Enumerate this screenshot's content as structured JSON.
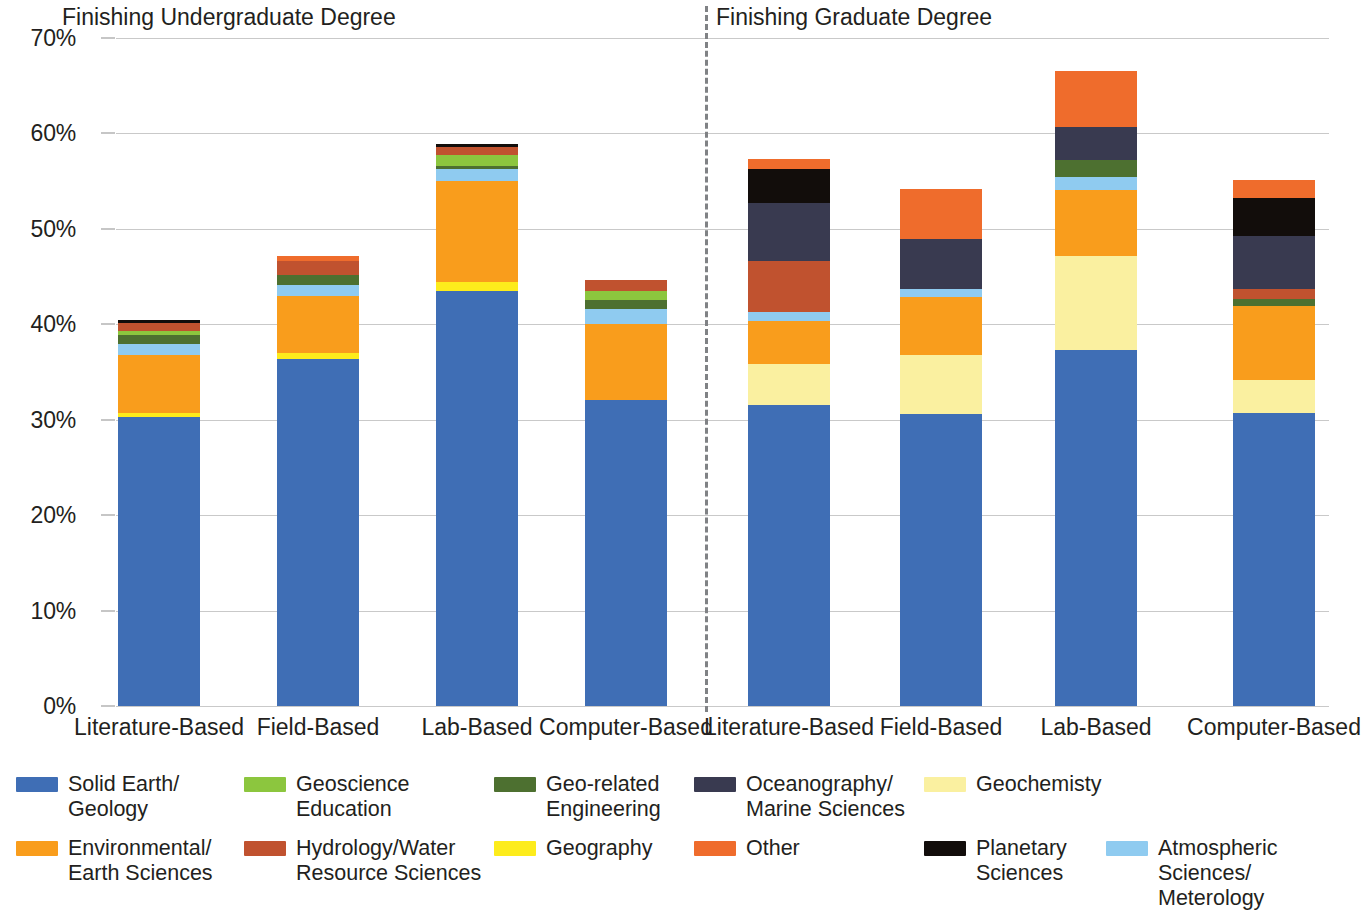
{
  "chart_data": {
    "type": "bar",
    "subtype": "stacked-column",
    "title": "",
    "xlabel": "",
    "ylabel": "Percentage of Graduates Participating in Self-Directed Research",
    "ylim": [
      0,
      70
    ],
    "ytick_values": [
      0,
      10,
      20,
      30,
      40,
      50,
      60,
      70
    ],
    "ytick_labels": [
      "0%",
      "10%",
      "20%",
      "30%",
      "40%",
      "50%",
      "60%",
      "70%"
    ],
    "grid": true,
    "legend_position": "bottom",
    "group_headers": [
      "Finishing Undergraduate Degree",
      "Finishing Graduate Degree"
    ],
    "categories": [
      "Literature-Based",
      "Field-Based",
      "Lab-Based",
      "Computer-Based",
      "Literature-Based",
      "Field-Based",
      "Lab-Based",
      "Computer-Based"
    ],
    "series": [
      {
        "name": "Solid Earth/\nGeology",
        "color": "#3f6eb5",
        "values": [
          30.3,
          36.4,
          43.5,
          32.1,
          31.5,
          30.6,
          37.3,
          30.7
        ]
      },
      {
        "name": "Geography",
        "color": "#fdec1c",
        "values": [
          0.4,
          0.6,
          0.9,
          0.0,
          0.0,
          0.0,
          0.0,
          0.0
        ]
      },
      {
        "name": "Geochemisty",
        "color": "#faf0a0",
        "values": [
          0.0,
          0.0,
          0.0,
          0.0,
          4.3,
          6.2,
          9.9,
          3.5
        ]
      },
      {
        "name": "Environmental/\nEarth Sciences",
        "color": "#f99d1c",
        "values": [
          6.1,
          6.0,
          10.6,
          7.9,
          4.5,
          6.1,
          6.9,
          7.7
        ]
      },
      {
        "name": "Atmospheric Sciences/\nMeterology",
        "color": "#8fcbf0",
        "values": [
          1.1,
          1.1,
          1.3,
          1.6,
          1.0,
          0.8,
          1.3,
          0.0
        ]
      },
      {
        "name": "Geo-related\nEngineering",
        "color": "#4d7030",
        "values": [
          1.0,
          1.1,
          0.3,
          1.0,
          0.0,
          0.0,
          1.8,
          0.8
        ]
      },
      {
        "name": "Geoscience\nEducation",
        "color": "#8cc63e",
        "values": [
          0.4,
          0.0,
          1.1,
          0.9,
          0.0,
          0.0,
          0.0,
          0.0
        ]
      },
      {
        "name": "Hydrology/Water\nResource Sciences",
        "color": "#c0522f",
        "values": [
          0.8,
          1.4,
          0.9,
          1.1,
          5.3,
          0.0,
          0.0,
          1.0
        ]
      },
      {
        "name": "Oceanography/\nMarine Sciences",
        "color": "#393a50",
        "values": [
          0.0,
          0.0,
          0.0,
          0.0,
          6.1,
          5.2,
          3.5,
          5.6
        ]
      },
      {
        "name": "Planetary\nSciences",
        "color": "#120d0b",
        "values": [
          0.4,
          0.0,
          0.3,
          0.0,
          3.6,
          0.0,
          0.0,
          3.9
        ]
      },
      {
        "name": "Other",
        "color": "#ef6c2c",
        "values": [
          0.0,
          0.6,
          0.0,
          0.0,
          1.0,
          5.3,
          5.9,
          1.9
        ]
      }
    ]
  },
  "legend": {
    "items": [
      {
        "label": "Solid Earth/\nGeology",
        "color": "#3f6eb5"
      },
      {
        "label": "Geoscience\nEducation",
        "color": "#8cc63e"
      },
      {
        "label": "Geo-related\nEngineering",
        "color": "#4d7030"
      },
      {
        "label": "Oceanography/\nMarine Sciences",
        "color": "#393a50"
      },
      {
        "label": "Geochemisty",
        "color": "#faf0a0"
      },
      {
        "label": "Environmental/\nEarth Sciences",
        "color": "#f99d1c"
      },
      {
        "label": "Hydrology/Water\nResource Sciences",
        "color": "#c0522f"
      },
      {
        "label": "Geography",
        "color": "#fdec1c"
      },
      {
        "label": "Other",
        "color": "#ef6c2c"
      },
      {
        "label": "Planetary\nSciences",
        "color": "#120d0b"
      },
      {
        "label": "Atmospheric Sciences/\nMeterology",
        "color": "#8fcbf0"
      }
    ]
  }
}
